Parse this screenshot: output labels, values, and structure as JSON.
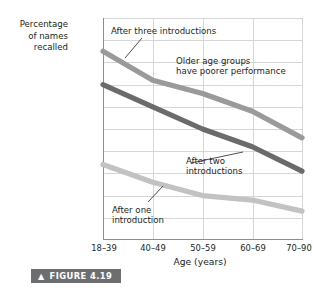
{
  "figure": {
    "caption_label": "FIGURE 4.19",
    "caret_icon": "▲",
    "banner_color": "#6d6e70"
  },
  "chart_data": {
    "type": "line",
    "title": "",
    "xlabel": "Age (years)",
    "ylabel": "Percentage\nof names\nrecalled",
    "categories": [
      "18–39",
      "40–49",
      "50–59",
      "60–69",
      "70–90"
    ],
    "ylim": [
      0,
      100
    ],
    "yticks": [
      0,
      10,
      20,
      30,
      40,
      50,
      60,
      70,
      80,
      90,
      100
    ],
    "ytick_labels": [
      "0",
      "10",
      "20",
      "30",
      "40",
      "50",
      "60",
      "70",
      "80",
      "90",
      "100%"
    ],
    "grid": true,
    "legend": "none",
    "series": [
      {
        "name": "After three introductions",
        "values": [
          85,
          72,
          66,
          58,
          46
        ],
        "color": "#9a9a9a"
      },
      {
        "name": "After two introductions",
        "values": [
          70,
          60,
          50,
          42,
          31
        ],
        "color": "#6b6b6b"
      },
      {
        "name": "After one introduction",
        "values": [
          34,
          26,
          20,
          18,
          13
        ],
        "color": "#c2c2c2"
      }
    ],
    "annotations": [
      {
        "id": "three",
        "text": "After three introductions"
      },
      {
        "id": "older",
        "text": "Older age groups\nhave poorer performance"
      },
      {
        "id": "two",
        "text": "After two\nintroductions"
      },
      {
        "id": "one",
        "text": "After one\nintroduction"
      }
    ]
  }
}
